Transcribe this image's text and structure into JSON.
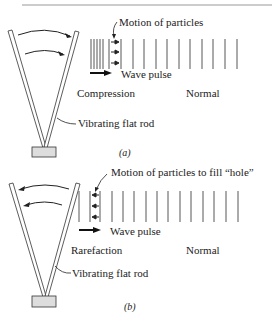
{
  "panels": [
    {
      "id": "a",
      "caption": "(a)",
      "labels": {
        "motion": "Motion of particles",
        "wave_pulse": "Wave pulse",
        "region_left": "Compression",
        "region_right": "Normal",
        "rod": "Vibrating flat rod"
      },
      "rod_motion": "rightward"
    },
    {
      "id": "b",
      "caption": "(b)",
      "labels": {
        "motion": "Motion of particles to fill “hole”",
        "wave_pulse": "Wave pulse",
        "region_left": "Rarefaction",
        "region_right": "Normal",
        "rod": "Vibrating flat rod"
      },
      "rod_motion": "leftward"
    }
  ],
  "colors": {
    "ink": "#222222",
    "base_fill": "#dddddd",
    "rule": "#999999"
  }
}
